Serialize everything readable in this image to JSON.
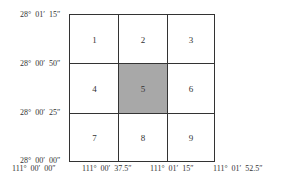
{
  "diagram": {
    "type": "grid",
    "rows": 3,
    "cols": 3,
    "highlight_cell": "5",
    "highlight_color": "#a8a8a8",
    "cells": [
      {
        "label": "1"
      },
      {
        "label": "2"
      },
      {
        "label": "3"
      },
      {
        "label": "4"
      },
      {
        "label": "5"
      },
      {
        "label": "6"
      },
      {
        "label": "7"
      },
      {
        "label": "8"
      },
      {
        "label": "9"
      }
    ],
    "latitude_labels": [
      "28°  01′  15″",
      "28°  00′  50″",
      "28°  00′  25″",
      "28°  00′  00″"
    ],
    "longitude_labels": [
      "111°  00′  00″",
      "111°  00′  37.5″",
      "111°  01′  15″",
      "111°  01′  52.5″"
    ]
  }
}
